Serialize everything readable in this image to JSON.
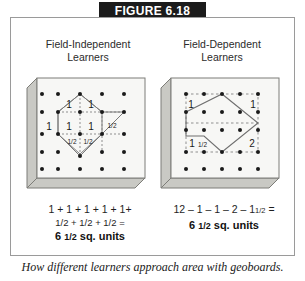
{
  "figure": {
    "title": "FIGURE 6.18",
    "caption": "How different learners approach area with geoboards.",
    "title_bar_color": "#1b1b1b",
    "panel_border_color": "#9a9a9a",
    "board_face_color": "#f7f7f5",
    "board_shade_color": "#c9c9c4",
    "peg_color": "#1a1a1a",
    "shape_line_color": "#6f6f6f",
    "dash_line_color": "#8f8f8f"
  },
  "columns": [
    {
      "id": "field-independent",
      "heading_line1": "Field-Independent",
      "heading_line2": "Learners",
      "equation_line1": "1 + 1 + 1 + 1 + 1+",
      "equation_line2": "1/2 + 1/2 + 1/2 =",
      "result_number": "6",
      "result_fraction": "1/2",
      "result_units": "sq. units",
      "board_labels": [
        {
          "text": "1",
          "x": 46,
          "y": 33
        },
        {
          "text": "1",
          "x": 68,
          "y": 33
        },
        {
          "text": "1",
          "x": 24,
          "y": 55
        },
        {
          "text": "1",
          "x": 46,
          "y": 55
        },
        {
          "text": "1",
          "x": 68,
          "y": 55
        },
        {
          "text": "1/2",
          "x": 88,
          "y": 55
        },
        {
          "text": "1/2",
          "x": 46,
          "y": 76
        },
        {
          "text": "1/2",
          "x": 62,
          "y": 76
        }
      ]
    },
    {
      "id": "field-dependent",
      "heading_line1": "Field-Dependent",
      "heading_line2": "Learners",
      "equation_line1": "12 – 1 – 1 – 2 – 1",
      "equation_line1_frac": "1/2",
      "equation_line1_tail": " =",
      "result_number": "6",
      "result_fraction": "1/2",
      "result_units": "sq. units",
      "board_labels": [
        {
          "text": "1",
          "x": 22,
          "y": 28
        },
        {
          "text": "1",
          "x": 90,
          "y": 28
        },
        {
          "text": "1",
          "x": 26,
          "y": 72,
          "frac": "1/2"
        },
        {
          "text": "2",
          "x": 88,
          "y": 72
        }
      ]
    }
  ],
  "geoboard": {
    "rows": 5,
    "cols": 5,
    "left_shape_name": "hexagon-subdivided",
    "right_shape_name": "pentagon-in-bounding-box"
  }
}
